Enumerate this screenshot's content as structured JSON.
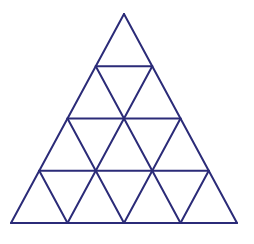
{
  "diagram": {
    "rows": 4,
    "stroke_color": "#2b2b78",
    "background": "#ffffff",
    "apex": [
      124,
      14
    ],
    "base_left": [
      11,
      223
    ],
    "base_right": [
      237,
      223
    ]
  }
}
